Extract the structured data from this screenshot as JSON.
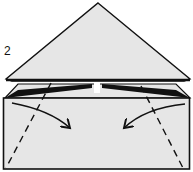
{
  "diagram": {
    "type": "origami-instruction",
    "step_number": "2",
    "fill_color": "#e6e6e6",
    "line_color": "#111111",
    "elements": [
      {
        "name": "top-triangle-flap",
        "kind": "polygon"
      },
      {
        "name": "rear-trapezoid-layer",
        "kind": "polygon"
      },
      {
        "name": "base-rectangle",
        "kind": "polygon"
      },
      {
        "name": "left-valley-fold-line",
        "kind": "dashed-line"
      },
      {
        "name": "right-valley-fold-line",
        "kind": "dashed-line"
      },
      {
        "name": "left-fold-arrow",
        "kind": "arrow"
      },
      {
        "name": "right-fold-arrow",
        "kind": "arrow"
      }
    ]
  }
}
